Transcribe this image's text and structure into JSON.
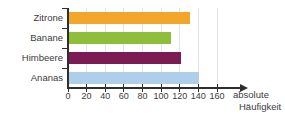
{
  "chart_data": {
    "type": "bar",
    "orientation": "horizontal",
    "categories": [
      "Zitrone",
      "Banane",
      "Himbeere",
      "Ananas"
    ],
    "values": [
      130,
      110,
      120,
      140
    ],
    "bar_colors": [
      "#F3A62A",
      "#8FBE3B",
      "#7B1D52",
      "#AFCEE9"
    ],
    "xlabel": "absolute Häufigkeit",
    "xlabel_lines": [
      "absolute",
      "Häufigkeit"
    ],
    "x_ticks": [
      0,
      20,
      40,
      60,
      80,
      100,
      120,
      140,
      160
    ],
    "xlim": [
      0,
      160
    ],
    "grid": true,
    "legend": false,
    "colors": {
      "grid": "#DFE5EC",
      "axis": "#2E2E2E",
      "text": "#3B3B3B",
      "background": "#FFFFFF"
    }
  }
}
